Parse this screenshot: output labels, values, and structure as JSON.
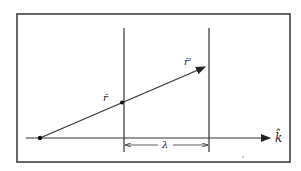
{
  "diagram": {
    "type": "vector-geometry",
    "labels": {
      "r_vector": "r̄",
      "r_prime_vector": "r̄'",
      "wavelength": "λ",
      "k_hat": "k̂"
    },
    "elements": {
      "frame": {
        "x": 17,
        "y": 14,
        "w": 273,
        "h": 148
      },
      "axis": {
        "x1": 26,
        "y": 138,
        "x2": 270,
        "direction_label": "k̂"
      },
      "origin_point": {
        "x": 40,
        "y": 138
      },
      "plane_left": {
        "x": 124,
        "y1": 28,
        "y2": 152
      },
      "plane_right": {
        "x": 209,
        "y1": 28,
        "y2": 152
      },
      "vector": {
        "x1": 40,
        "y1": 138,
        "x2": 205,
        "y2": 67
      },
      "intersection_point": {
        "x": 122,
        "y": 102
      },
      "dimension": {
        "y": 145,
        "x1": 124,
        "x2": 209,
        "label": "λ"
      }
    },
    "colors": {
      "stroke": "#333333",
      "background": "#ffffff"
    }
  }
}
